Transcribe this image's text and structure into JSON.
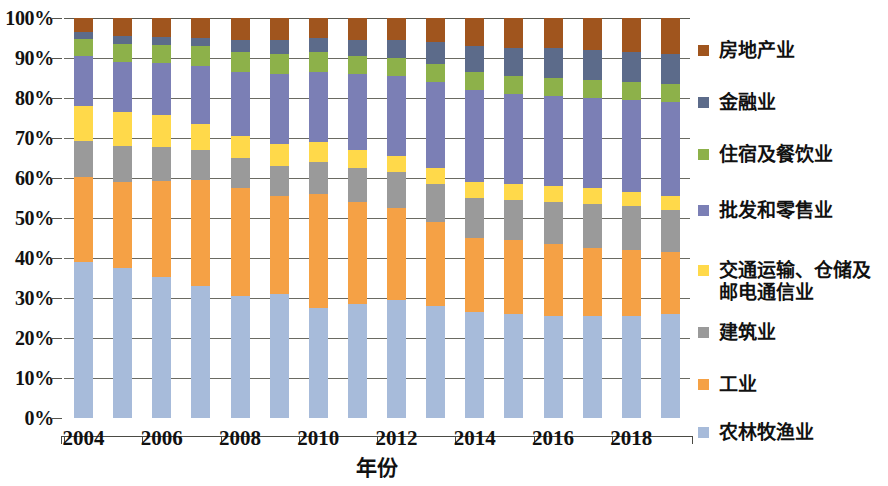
{
  "chart_data": {
    "type": "bar",
    "subtype": "stacked-100-percent",
    "title": "",
    "xlabel": "年份",
    "ylabel": "",
    "ylim": [
      0,
      100
    ],
    "yticks": [
      0,
      10,
      20,
      30,
      40,
      50,
      60,
      70,
      80,
      90,
      100
    ],
    "ytick_labels": [
      "0%",
      "10%",
      "20%",
      "30%",
      "40%",
      "50%",
      "60%",
      "70%",
      "80%",
      "90%",
      "100%"
    ],
    "grid": true,
    "legend_position": "right",
    "categories": [
      "2004",
      "2005",
      "2006",
      "2007",
      "2008",
      "2009",
      "2007",
      "2011",
      "2012",
      "2013",
      "2014",
      "2015",
      "2016",
      "2017",
      "2018",
      "2019"
    ],
    "x": [
      2004,
      2005,
      2006,
      2007,
      2008,
      2009,
      2010,
      2011,
      2012,
      2013,
      2014,
      2015,
      2016,
      2017,
      2018,
      2019
    ],
    "xtick_labels": [
      "2004",
      "2006",
      "2008",
      "2010",
      "2012",
      "2014",
      "2016",
      "2018"
    ],
    "xtick_values": [
      2004,
      2006,
      2008,
      2010,
      2012,
      2014,
      2016,
      2018
    ],
    "series": [
      {
        "name": "农林牧渔业",
        "color": "#a7bbda",
        "values": [
          39.0,
          37.5,
          35.2,
          33.0,
          30.5,
          31.0,
          27.5,
          28.5,
          29.5,
          28.0,
          26.5,
          26.0,
          25.5,
          25.5,
          25.5,
          26.0
        ]
      },
      {
        "name": "工业",
        "color": "#f5a145",
        "values": [
          21.3,
          21.5,
          24.0,
          26.5,
          27.0,
          24.5,
          28.5,
          25.5,
          23.0,
          21.0,
          18.5,
          18.5,
          18.0,
          17.0,
          16.5,
          15.5
        ]
      },
      {
        "name": "建筑业",
        "color": "#9a9a9a",
        "values": [
          9.0,
          9.0,
          8.5,
          7.5,
          7.5,
          7.5,
          8.0,
          8.5,
          9.0,
          9.5,
          10.0,
          10.0,
          10.5,
          11.0,
          11.0,
          10.5
        ]
      },
      {
        "name": "交通运输、仓储及邮电通信业",
        "color": "#ffd94a",
        "values": [
          8.7,
          8.5,
          8.0,
          6.5,
          5.5,
          5.5,
          5.0,
          4.5,
          4.0,
          4.0,
          4.0,
          4.0,
          4.0,
          4.0,
          3.5,
          3.5
        ]
      },
      {
        "name": "批发和零售业",
        "color": "#7b7fb5",
        "values": [
          12.5,
          12.5,
          13.0,
          14.5,
          16.0,
          17.5,
          17.5,
          19.0,
          20.0,
          21.5,
          23.0,
          22.5,
          22.5,
          22.5,
          23.0,
          23.5
        ]
      },
      {
        "name": "住宿及餐饮业",
        "color": "#8db14a",
        "values": [
          4.3,
          4.5,
          4.5,
          5.0,
          5.0,
          5.0,
          5.0,
          4.5,
          4.5,
          4.5,
          4.5,
          4.5,
          4.5,
          4.5,
          4.5,
          4.5
        ]
      },
      {
        "name": "金融业",
        "color": "#5c6b8a",
        "values": [
          1.7,
          2.0,
          2.0,
          2.0,
          3.0,
          3.5,
          3.5,
          4.0,
          4.5,
          5.5,
          6.5,
          7.0,
          7.5,
          7.5,
          7.5,
          7.5
        ]
      },
      {
        "name": "房地产业",
        "color": "#a0551e",
        "values": [
          3.5,
          4.5,
          4.8,
          5.0,
          5.5,
          5.5,
          5.0,
          5.5,
          5.5,
          6.0,
          7.0,
          7.5,
          7.5,
          8.0,
          8.5,
          9.0
        ]
      }
    ],
    "legend_entries": [
      {
        "label": "房地产业",
        "color": "#a0551e"
      },
      {
        "label": "金融业",
        "color": "#5c6b8a"
      },
      {
        "label": "住宿及餐饮业",
        "color": "#8db14a"
      },
      {
        "label": "批发和零售业",
        "color": "#7b7fb5"
      },
      {
        "label": "交通运输、仓储及\n邮电通信业",
        "color": "#ffd94a"
      },
      {
        "label": "建筑业",
        "color": "#9a9a9a"
      },
      {
        "label": "工业",
        "color": "#f5a145"
      },
      {
        "label": "农林牧渔业",
        "color": "#a7bbda"
      }
    ]
  }
}
